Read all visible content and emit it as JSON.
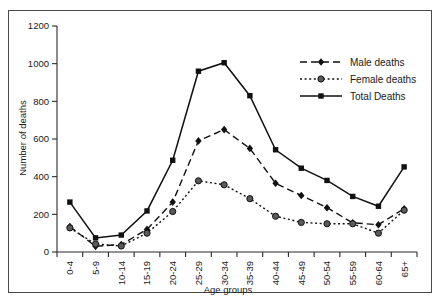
{
  "figure": {
    "clipped_caption_above": "",
    "frame_color": "#4a4a4a",
    "background": "#ffffff"
  },
  "chart_data": {
    "type": "line",
    "title": "",
    "xlabel": "Age groups",
    "ylabel": "Number of deaths",
    "categories": [
      "0-4",
      "5-9",
      "10-14",
      "15-19",
      "20-24",
      "25-29",
      "30-34",
      "35-39",
      "40-44",
      "45-49",
      "50-54",
      "55-59",
      "60-64",
      "65+"
    ],
    "ylim": [
      0,
      1200
    ],
    "yticks": [
      0,
      200,
      400,
      600,
      800,
      1000,
      1200
    ],
    "grid": false,
    "legend_position": "upper right",
    "series": [
      {
        "name": "Male deaths",
        "color": "#111111",
        "marker": "diamond",
        "dash": "7,4",
        "values": [
          135,
          30,
          40,
          120,
          265,
          590,
          650,
          550,
          365,
          300,
          235,
          155,
          145,
          230
        ]
      },
      {
        "name": "Female deaths",
        "color": "#111111",
        "marker": "circle",
        "dash": "2,2.6",
        "values": [
          128,
          42,
          32,
          100,
          215,
          378,
          357,
          283,
          190,
          157,
          150,
          150,
          100,
          222
        ]
      },
      {
        "name": "Total Deaths",
        "color": "#111111",
        "marker": "square",
        "dash": "none",
        "values": [
          265,
          75,
          90,
          218,
          487,
          960,
          1005,
          830,
          543,
          445,
          380,
          295,
          243,
          452
        ]
      }
    ]
  },
  "axis": {
    "y_tick_labels": [
      "0",
      "200",
      "400",
      "600",
      "800",
      "1000",
      "1200"
    ],
    "y_axis_title": "Number of deaths",
    "x_axis_title": "Age groups"
  },
  "legend": {
    "entries": [
      {
        "label": "Male deaths"
      },
      {
        "label": "Female deaths"
      },
      {
        "label": "Total Deaths"
      }
    ]
  }
}
